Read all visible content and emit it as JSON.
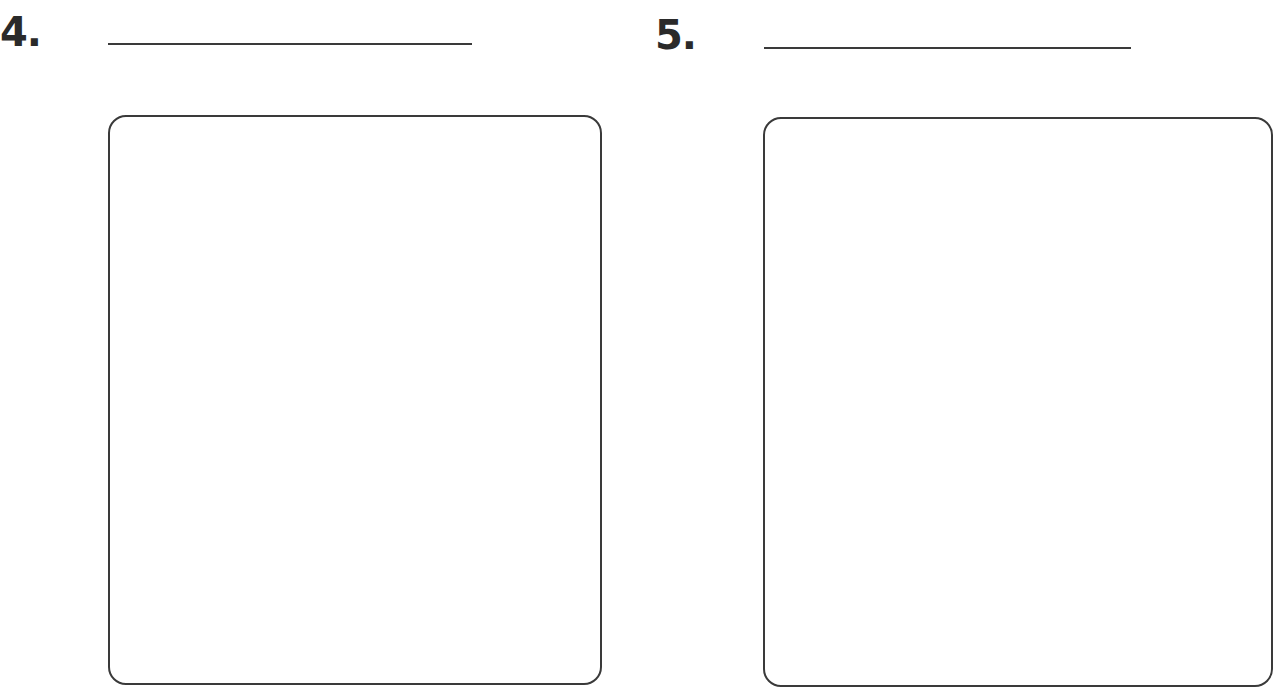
{
  "worksheet": {
    "items": [
      {
        "number": "4.",
        "answer_line": "",
        "drawing_box": ""
      },
      {
        "number": "5.",
        "answer_line": "",
        "drawing_box": ""
      }
    ]
  },
  "colors": {
    "ink": "#3a3a3a",
    "background": "#ffffff"
  }
}
